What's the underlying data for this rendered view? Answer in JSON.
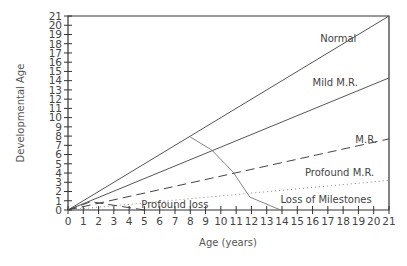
{
  "chart_data": {
    "type": "line",
    "title": "",
    "xlabel": "Age (years)",
    "ylabel": "Developmental Age",
    "xlim": [
      0,
      21
    ],
    "ylim": [
      0,
      21
    ],
    "x_ticks": [
      0,
      1,
      2,
      3,
      4,
      5,
      6,
      7,
      8,
      9,
      10,
      11,
      12,
      13,
      14,
      15,
      16,
      17,
      18,
      19,
      20,
      21
    ],
    "y_ticks": [
      0,
      1,
      2,
      3,
      4,
      5,
      6,
      7,
      8,
      9,
      10,
      11,
      12,
      13,
      14,
      15,
      16,
      17,
      18,
      19,
      20,
      21
    ],
    "grid": false,
    "legend": "inline labels",
    "series": [
      {
        "name": "Normal",
        "style": "solid",
        "x": [
          0,
          21
        ],
        "y": [
          0,
          21
        ],
        "label_pos": [
          16.5,
          18.2
        ]
      },
      {
        "name": "Mild M.R.",
        "style": "solid",
        "x": [
          0,
          21
        ],
        "y": [
          0,
          14.3
        ],
        "label_pos": [
          16.0,
          13.4
        ]
      },
      {
        "name": "M.R.",
        "style": "dashed",
        "x": [
          0,
          21
        ],
        "y": [
          0,
          7.7
        ],
        "label_pos": [
          18.8,
          7.3
        ]
      },
      {
        "name": "Profound M.R.",
        "style": "dotted",
        "x": [
          0,
          21
        ],
        "y": [
          0,
          3.2
        ],
        "label_pos": [
          15.5,
          3.7
        ]
      },
      {
        "name": "Loss of Milestones",
        "style": "solid-thin",
        "x": [
          8.0,
          9.4,
          10.8,
          11.9,
          13.9
        ],
        "y": [
          7.9,
          6.5,
          4.1,
          1.4,
          0
        ],
        "label_pos": [
          13.9,
          0.8
        ]
      },
      {
        "name": "Profound loss",
        "style": "dashed",
        "x": [
          0,
          1.5,
          5.0
        ],
        "y": [
          0,
          0.9,
          0
        ],
        "label_pos": [
          4.8,
          0.2
        ]
      }
    ]
  }
}
